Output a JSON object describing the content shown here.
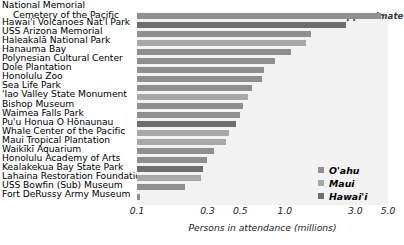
{
  "chart_data": {
    "type": "bar",
    "orientation": "horizontal",
    "title": "",
    "xlabel": "Persons in attendance (millions)",
    "ylabel": "",
    "xscale": "log",
    "xlim": [
      0.1,
      5.0
    ],
    "grid": false,
    "annotation": "approximate",
    "ticks": [
      {
        "label": "0.1",
        "value": 0.1
      },
      {
        "label": "0.3",
        "value": 0.3
      },
      {
        "label": "0.5",
        "value": 0.5
      },
      {
        "label": "1.0",
        "value": 1.0
      },
      {
        "label": "3.0",
        "value": 3.0
      },
      {
        "label": "5.0",
        "value": 5.0
      }
    ],
    "legend": {
      "position": "bottom-right",
      "entries": [
        {
          "name": "O'ahu",
          "color": "#8f8f8f"
        },
        {
          "name": "Maui",
          "color": "#a8a8a8"
        },
        {
          "name": "Hawai'i",
          "color": "#6e6e6e"
        }
      ]
    },
    "categories": [
      "National Memorial Cemetery of the Pacific",
      "Hawai'i Volcanoes Nat'l Park",
      "USS Arizona Memorial",
      "Haleakalā National Park",
      "Hanauma Bay",
      "Polynesian Cultural Center",
      "Dole Plantation",
      "Honolulu Zoo",
      "Sea Life Park",
      "'Iao Valley State Monument",
      "Bishop Museum",
      "Waimea Falls Park",
      "Pu'u Honua O Hōnaunau",
      "Whale Center of the Pacific",
      "Maui Tropical Plantation",
      "Waikīkī Aquarium",
      "Honolulu Academy of Arts",
      "Kealakekua Bay State Park",
      "Lahaina Restoration Foundation",
      "USS Bowfin (Sub) Museum",
      "Fort DeRussy Army Museum"
    ],
    "values": [
      4.5,
      2.6,
      1.5,
      1.4,
      1.1,
      0.86,
      0.72,
      0.7,
      0.6,
      0.56,
      0.52,
      0.5,
      0.47,
      0.42,
      0.4,
      0.33,
      0.3,
      0.28,
      0.27,
      0.21,
      0.105
    ],
    "groups": [
      "O'ahu",
      "Hawai'i",
      "O'ahu",
      "Maui",
      "O'ahu",
      "O'ahu",
      "O'ahu",
      "O'ahu",
      "O'ahu",
      "Maui",
      "O'ahu",
      "O'ahu",
      "Hawai'i",
      "Maui",
      "Maui",
      "O'ahu",
      "O'ahu",
      "Hawai'i",
      "Maui",
      "O'ahu",
      "O'ahu"
    ]
  },
  "labels": {
    "rows": [
      {
        "line1": "National Memorial",
        "line2": "Cemetery of the Pacific"
      },
      {
        "line1": "Hawai'i Volcanoes Nat'l Park",
        "line2": ""
      },
      {
        "line1": "USS Arizona Memorial",
        "line2": ""
      },
      {
        "line1": "Haleakalā National Park",
        "line2": ""
      },
      {
        "line1": "Hanauma Bay",
        "line2": ""
      },
      {
        "line1": "Polynesian Cultural Center",
        "line2": ""
      },
      {
        "line1": "Dole Plantation",
        "line2": ""
      },
      {
        "line1": "Honolulu Zoo",
        "line2": ""
      },
      {
        "line1": "Sea Life Park",
        "line2": ""
      },
      {
        "line1": "'Iao Valley State Monument",
        "line2": ""
      },
      {
        "line1": "Bishop Museum",
        "line2": ""
      },
      {
        "line1": "Waimea Falls Park",
        "line2": ""
      },
      {
        "line1": "Pu'u Honua O Hōnaunau",
        "line2": ""
      },
      {
        "line1": "Whale Center of the Pacific",
        "line2": ""
      },
      {
        "line1": "Maui Tropical Plantation",
        "line2": ""
      },
      {
        "line1": "Waikīkī Aquarium",
        "line2": ""
      },
      {
        "line1": "Honolulu Academy of Arts",
        "line2": ""
      },
      {
        "line1": "Kealakekua Bay State Park",
        "line2": ""
      },
      {
        "line1": "Lahaina Restoration Foundation",
        "line2": ""
      },
      {
        "line1": "USS Bowfin (Sub) Museum",
        "line2": ""
      },
      {
        "line1": "Fort DeRussy Army Museum",
        "line2": ""
      }
    ]
  }
}
